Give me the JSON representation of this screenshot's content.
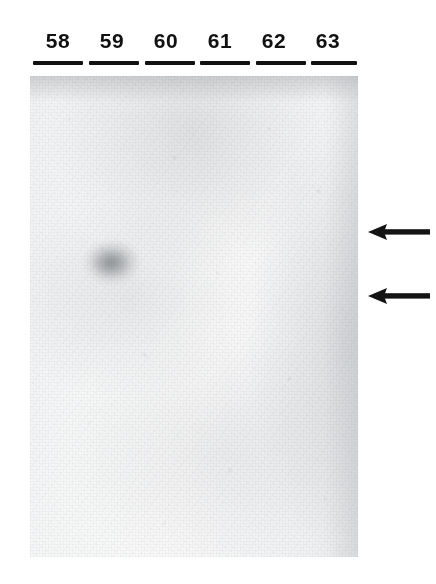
{
  "figure": {
    "type": "autoradiograph-blot",
    "description": "Autoradiograph film of an electrophoresis blot with six numbered lanes and two left-pointing arrows marking band positions",
    "background_color": "#ffffff",
    "film_color": "#f7f8f8",
    "ink_color": "#111111"
  },
  "lanes": [
    {
      "label": "58",
      "center_x": 58,
      "rule_left": 33,
      "rule_width": 50
    },
    {
      "label": "59",
      "center_x": 112,
      "rule_left": 89,
      "rule_width": 50
    },
    {
      "label": "60",
      "center_x": 166,
      "rule_left": 145,
      "rule_width": 50
    },
    {
      "label": "61",
      "center_x": 220,
      "rule_left": 200,
      "rule_width": 50
    },
    {
      "label": "62",
      "center_x": 274,
      "rule_left": 256,
      "rule_width": 50
    },
    {
      "label": "63",
      "center_x": 328,
      "rule_left": 311,
      "rule_width": 46
    }
  ],
  "blot": {
    "left": 30,
    "top": 76,
    "width": 328,
    "height": 481
  },
  "signals": [
    {
      "name": "faint-band-lane-59",
      "lane": "59",
      "left": 86,
      "top": 242,
      "width": 52,
      "height": 40,
      "intensity": "faint"
    }
  ],
  "arrows": [
    {
      "name": "upper-band-arrow",
      "top": 224,
      "left": 368,
      "direction": "left"
    },
    {
      "name": "lower-band-arrow",
      "top": 288,
      "left": 368,
      "direction": "left"
    }
  ]
}
